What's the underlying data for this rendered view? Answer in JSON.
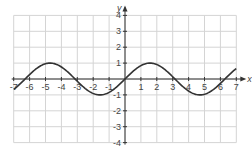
{
  "chart_data": {
    "type": "line",
    "title": "",
    "xlabel": "x",
    "ylabel": "y",
    "function": "y = sin(x)",
    "xlim": [
      -7,
      7
    ],
    "ylim": [
      -4,
      4
    ],
    "grid": true,
    "legend": null,
    "x_ticks": [
      -7,
      -6,
      -5,
      -4,
      -3,
      -2,
      -1,
      1,
      2,
      3,
      4,
      5,
      6,
      7
    ],
    "y_ticks": [
      -4,
      -3,
      -2,
      -1,
      1,
      2,
      3,
      4
    ],
    "x_tick_labels": [
      "-7",
      "-6",
      "-5",
      "-4",
      "-3",
      "-2",
      "-1",
      "1",
      "2",
      "3",
      "4",
      "5",
      "6",
      "7"
    ],
    "y_tick_labels": [
      "-4",
      "-3",
      "-2",
      "-1",
      "1",
      "2",
      "3",
      "4"
    ],
    "series": [
      {
        "name": "sin(x)",
        "x": [
          -7,
          -6.28,
          -4.71,
          -3.14,
          -1.57,
          0,
          1.57,
          3.14,
          4.71,
          6.28,
          7
        ],
        "values": [
          -0.66,
          0,
          1,
          0,
          -1,
          0,
          1,
          0,
          -1,
          0,
          0.66
        ]
      }
    ]
  },
  "colors": {
    "grid": "#d4d4d4",
    "axis": "#333333",
    "curve": "#333333",
    "label": "#444444"
  }
}
